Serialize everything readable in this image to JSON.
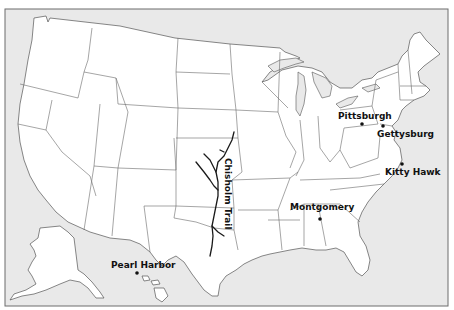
{
  "map": {
    "title": "United States outline map with historic locations",
    "colors": {
      "ocean": "#e9e9e9",
      "land": "#ffffff",
      "borders": "#6a6a6a",
      "labels": "#111111"
    },
    "locations": [
      {
        "id": "pittsburgh",
        "label": "Pittsburgh",
        "marker": "dot"
      },
      {
        "id": "gettysburg",
        "label": "Gettysburg",
        "marker": "dot"
      },
      {
        "id": "kitty-hawk",
        "label": "Kitty Hawk",
        "marker": "dot"
      },
      {
        "id": "montgomery",
        "label": "Montgomery",
        "marker": "dot"
      },
      {
        "id": "pearl-harbor",
        "label": "Pearl Harbor",
        "marker": "dot"
      }
    ],
    "routes": [
      {
        "id": "chisholm-trail",
        "label": "Chisholm Trail"
      }
    ]
  }
}
